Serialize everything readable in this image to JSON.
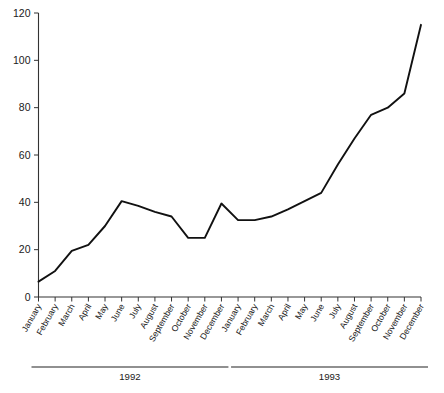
{
  "chart_data": {
    "type": "line",
    "title": "",
    "subtitle": "",
    "xlabel": "",
    "ylabel": "",
    "ylim": [
      0,
      120
    ],
    "ytick_labels": [
      "0",
      "20",
      "40",
      "60",
      "80",
      "100",
      "120"
    ],
    "ytick_values": [
      0,
      20,
      40,
      60,
      80,
      100,
      120
    ],
    "grid": false,
    "legend": false,
    "legend_position": "none",
    "categories": [
      "January",
      "February",
      "March",
      "April",
      "May",
      "June",
      "July",
      "August",
      "September",
      "October",
      "November",
      "December",
      "January",
      "February",
      "March",
      "April",
      "May",
      "June",
      "July",
      "August",
      "September",
      "October",
      "November",
      "December"
    ],
    "values": [
      6.5,
      11,
      19.5,
      22,
      30,
      40.5,
      38.5,
      36,
      34,
      25,
      25,
      39.5,
      32.5,
      32.5,
      34,
      37,
      40.5,
      44,
      56,
      67,
      77,
      80,
      86,
      115
    ],
    "group_labels": [
      "1992",
      "1993"
    ],
    "groups": [
      {
        "label": "1992",
        "start_index": 0,
        "end_index": 11
      },
      {
        "label": "1993",
        "start_index": 12,
        "end_index": 23
      }
    ],
    "line_color": "#111111",
    "axis_color": "#333333"
  }
}
